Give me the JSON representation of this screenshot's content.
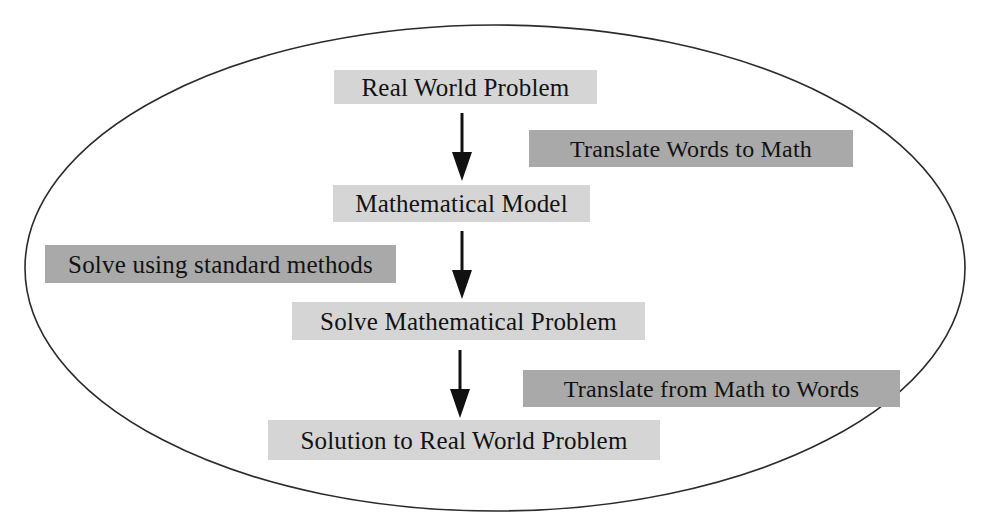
{
  "diagram": {
    "boundary": {
      "shape": "ellipse",
      "stroke_color": "#2b2b2b",
      "fill_color": "#ffffff",
      "stroke_width": 1.6,
      "center_x": 495,
      "center_y": 268,
      "radius_x": 470,
      "radius_y": 243
    },
    "palette": {
      "background": "#ffffff",
      "process_box_fill": "#d5d5d5",
      "annotation_box_fill": "#a9a9a9",
      "text_color": "#121212",
      "arrow_color": "#111111"
    },
    "nodes": [
      {
        "id": "real-world-problem",
        "label": "Real World Problem",
        "role": "process",
        "tone": "light"
      },
      {
        "id": "translate-words-to-math",
        "label": "Translate Words to Math",
        "role": "annotation",
        "tone": "dark"
      },
      {
        "id": "mathematical-model",
        "label": "Mathematical Model",
        "role": "process",
        "tone": "light"
      },
      {
        "id": "solve-using-standard-methods",
        "label": "Solve using standard methods",
        "role": "annotation",
        "tone": "dark"
      },
      {
        "id": "solve-mathematical-problem",
        "label": "Solve Mathematical Problem",
        "role": "process",
        "tone": "light"
      },
      {
        "id": "translate-from-math-to-words",
        "label": "Translate from Math to Words",
        "role": "annotation",
        "tone": "dark"
      },
      {
        "id": "solution-to-real-world-problem",
        "label": "Solution to Real World Problem",
        "role": "process",
        "tone": "light"
      }
    ],
    "arrows": [
      {
        "id": "arrow-1",
        "from": "real-world-problem",
        "to": "mathematical-model",
        "annotated_by": "translate-words-to-math",
        "direction": "down",
        "x": 462,
        "y_start": 113,
        "y_end": 180
      },
      {
        "id": "arrow-2",
        "from": "mathematical-model",
        "to": "solve-mathematical-problem",
        "annotated_by": "solve-using-standard-methods",
        "direction": "down",
        "x": 462,
        "y_start": 231,
        "y_end": 298
      },
      {
        "id": "arrow-3",
        "from": "solve-mathematical-problem",
        "to": "solution-to-real-world-problem",
        "annotated_by": "translate-from-math-to-words",
        "direction": "down",
        "x": 460,
        "y_start": 350,
        "y_end": 417
      }
    ]
  }
}
